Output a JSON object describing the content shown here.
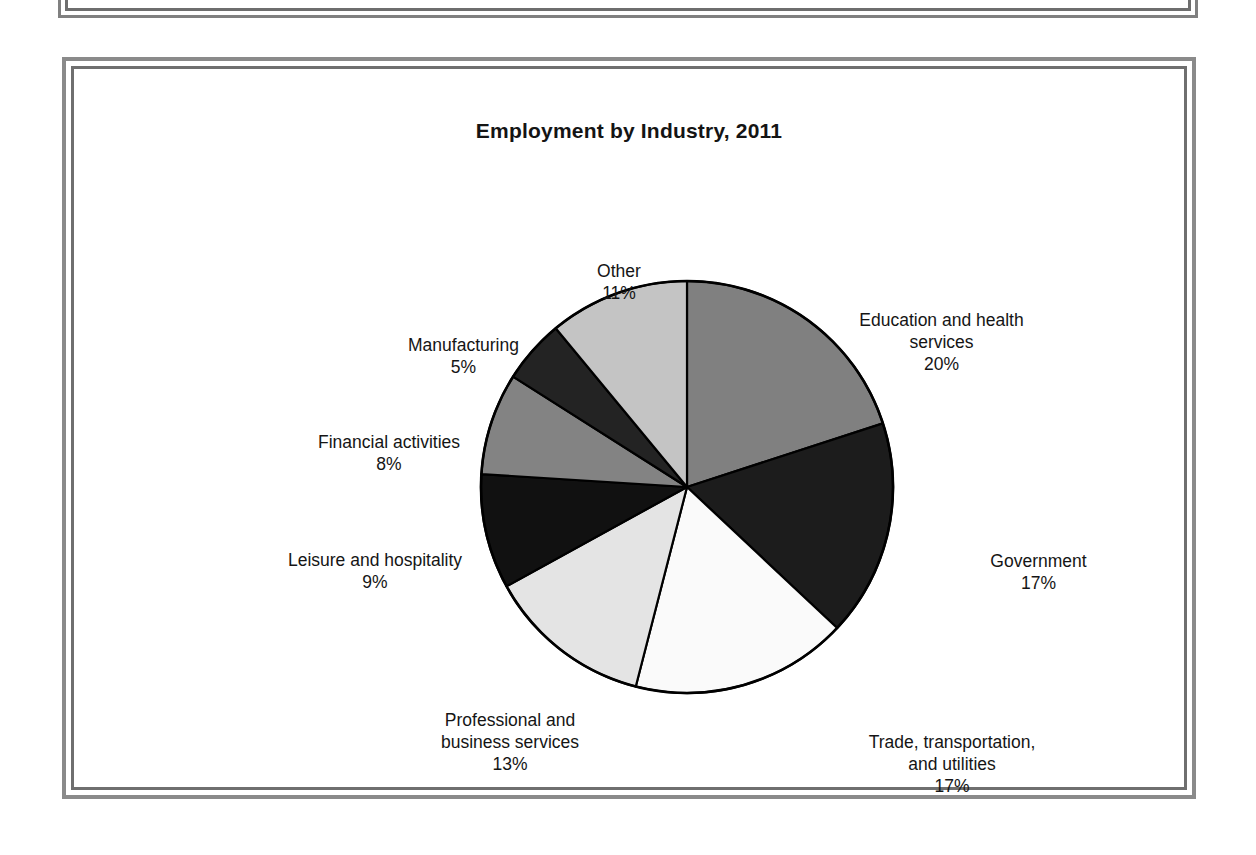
{
  "chart_data": {
    "type": "pie",
    "title": "Employment by Industry, 2011",
    "xlabel": "",
    "ylabel": "",
    "legend_position": "none",
    "labels_outside": true,
    "start_angle_deg": 0,
    "direction": "clockwise",
    "categories": [
      "Education and health services",
      "Government",
      "Trade, transportation, and utilities",
      "Professional and business services",
      "Leisure and hospitality",
      "Financial activities",
      "Manufacturing",
      "Other"
    ],
    "values": [
      20,
      17,
      17,
      13,
      9,
      8,
      5,
      11
    ],
    "unit": "%",
    "slices": [
      {
        "name": "Education and health services",
        "label_text": "Education and health\nservices\n20%",
        "value": 20,
        "value_text": "20%",
        "color": "#808080"
      },
      {
        "name": "Government",
        "label_text": "Government\n17%",
        "value": 17,
        "value_text": "17%",
        "color": "#1c1c1c"
      },
      {
        "name": "Trade, transportation, and utilities",
        "label_text": "Trade, transportation,\nand utilities\n17%",
        "value": 17,
        "value_text": "17%",
        "color": "#fafafa"
      },
      {
        "name": "Professional and business services",
        "label_text": "Professional and\nbusiness services\n13%",
        "value": 13,
        "value_text": "13%",
        "color": "#e4e4e4"
      },
      {
        "name": "Leisure and hospitality",
        "label_text": "Leisure and hospitality\n9%",
        "value": 9,
        "value_text": "9%",
        "color": "#111111"
      },
      {
        "name": "Financial activities",
        "label_text": "Financial activities\n8%",
        "value": 8,
        "value_text": "8%",
        "color": "#838383"
      },
      {
        "name": "Manufacturing",
        "label_text": "Manufacturing\n5%",
        "value": 5,
        "value_text": "5%",
        "color": "#232323"
      },
      {
        "name": "Other",
        "label_text": "Other\n11%",
        "value": 11,
        "value_text": "11%",
        "color": "#c4c4c4"
      }
    ],
    "stroke_color": "#000000"
  }
}
